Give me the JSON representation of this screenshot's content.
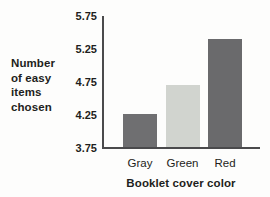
{
  "figure": {
    "y_axis_label": "Number\nof easy\nitems\nchosen",
    "x_axis_title": "Booklet cover color"
  },
  "chart_data": {
    "type": "bar",
    "categories": [
      "Gray",
      "Green",
      "Red"
    ],
    "values": [
      4.25,
      4.7,
      5.4
    ],
    "bar_colors": [
      "#6f6f71",
      "#d1d4cf",
      "#6a6a6c"
    ],
    "title": "",
    "xlabel": "Booklet cover color",
    "ylabel": "Number of easy items chosen",
    "ylim": [
      3.75,
      5.75
    ],
    "yticks": [
      "5.75",
      "5.25",
      "4.75",
      "4.25",
      "3.75"
    ],
    "grid": false,
    "legend": "none"
  },
  "colors": {
    "axis": "#4a4a4c",
    "text": "#1e1e20",
    "background": "#fdfdfc"
  }
}
